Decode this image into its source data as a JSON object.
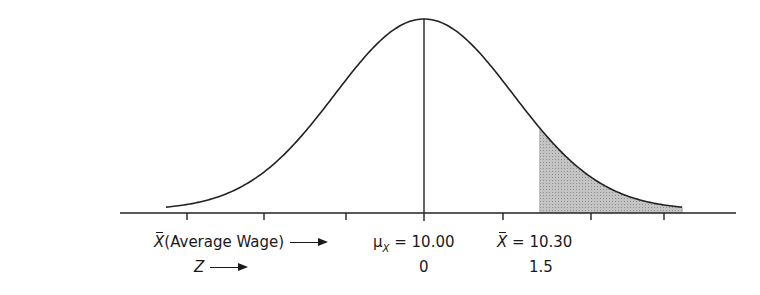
{
  "diagram": {
    "type": "normal-distribution-sampling",
    "axis_rows": [
      {
        "label_main": "X",
        "label_rest": "(Average Wage)",
        "overbar": true
      },
      {
        "label_main": "Z",
        "label_rest": "",
        "overbar": false
      }
    ],
    "mean_label": {
      "symbol": "μ",
      "subscript": "X",
      "equals": "=",
      "value": "10.00"
    },
    "sample_label": {
      "symbol": "X",
      "equals": "=",
      "value": "10.30"
    },
    "z_values": {
      "mean": "0",
      "sample": "1.5"
    },
    "shaded_region": "right tail beyond Z = 1.5",
    "colors": {
      "curve": "#222222",
      "shade": "#b8b8b8",
      "axis": "#222222"
    }
  }
}
